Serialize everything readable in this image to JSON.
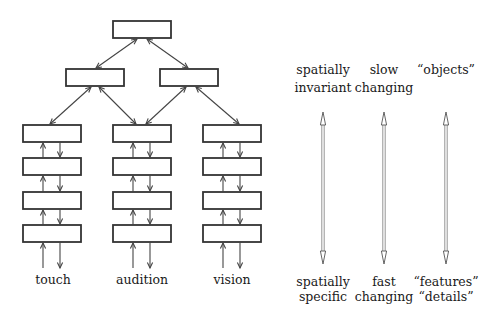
{
  "diagram": {
    "hierarchy": {
      "levels": [
        {
          "name": "top",
          "nodes": [
            "top-node"
          ]
        },
        {
          "name": "middle",
          "nodes": [
            "middle-left-node",
            "middle-right-node"
          ]
        },
        {
          "name": "modality",
          "nodes": [
            "touch-stack",
            "audition-stack",
            "vision-stack"
          ]
        }
      ],
      "stack_depth": 4,
      "connections": [
        {
          "from": "top-node",
          "to": "middle-left-node",
          "bidirectional": true
        },
        {
          "from": "top-node",
          "to": "middle-right-node",
          "bidirectional": true
        },
        {
          "from": "middle-left-node",
          "to": "touch-stack",
          "bidirectional": true
        },
        {
          "from": "middle-left-node",
          "to": "audition-stack",
          "bidirectional": true
        },
        {
          "from": "middle-right-node",
          "to": "audition-stack",
          "bidirectional": true
        },
        {
          "from": "middle-right-node",
          "to": "vision-stack",
          "bidirectional": true
        }
      ],
      "modalities": [
        {
          "label": "touch"
        },
        {
          "label": "audition"
        },
        {
          "label": "vision"
        }
      ]
    },
    "gradients": [
      {
        "top_lines": [
          "spatially",
          "invariant"
        ],
        "bottom_lines": [
          "spatially",
          "specific"
        ]
      },
      {
        "top_lines": [
          "slow",
          "changing"
        ],
        "bottom_lines": [
          "fast",
          "changing"
        ]
      },
      {
        "top_lines": [
          "“objects”"
        ],
        "bottom_lines": [
          "“features”",
          "“details”"
        ]
      }
    ]
  }
}
